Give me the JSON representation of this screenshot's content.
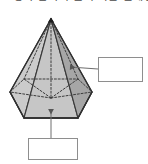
{
  "header": {
    "text": "도형의 면의 수를 구하는 문제입니다",
    "note": "clipped"
  },
  "figure": {
    "name": "hexagonal-pyramid",
    "apex_marker": "vertex-dot",
    "colors": {
      "outline": "#3a3a3a",
      "hidden_edge": "#4a4a4a",
      "face_left": "#cbcbcb",
      "face_front_left": "#bfbfbf",
      "face_front_center": "#c6c6c6",
      "face_front_right": "#b2b2b2",
      "face_right": "#a6a6a6",
      "base_front": "#c2c2c2",
      "leader": "#6e6e6e",
      "box_border": "#8e8e8e",
      "background": "#ffffff"
    },
    "geometry": {
      "apex": [
        51,
        19
      ],
      "base_vertices": [
        [
          10,
          92
        ],
        [
          24,
          79
        ],
        [
          78,
          79
        ],
        [
          92,
          92
        ],
        [
          78,
          118
        ],
        [
          24,
          118
        ]
      ],
      "base_center": [
        51,
        98
      ],
      "height_axis": [
        [
          51,
          19
        ],
        [
          51,
          98
        ]
      ]
    }
  },
  "callouts": [
    {
      "id": "lateral-face-callout",
      "label": "",
      "placeholder": "",
      "arrow": "left",
      "arrow_tip": [
        68,
        67
      ],
      "box": [
        98,
        57,
        45,
        25
      ]
    },
    {
      "id": "base-face-callout",
      "label": "",
      "placeholder": "",
      "arrow": "up",
      "arrow_tip": [
        51,
        107
      ],
      "box": [
        28,
        138,
        50,
        22
      ]
    }
  ]
}
